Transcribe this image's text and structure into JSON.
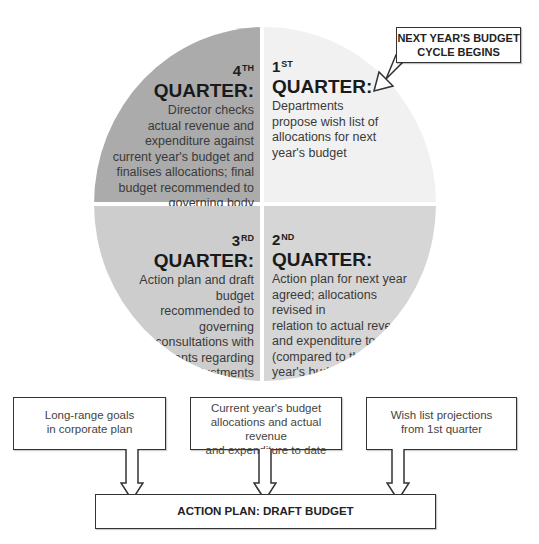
{
  "diagram": {
    "quarters": [
      {
        "id": "q1",
        "number": "1",
        "suffix": "ST",
        "title": "QUARTER:",
        "text": "Departments propose wish list of allocations for next year's budget",
        "lines": [
          "Departments",
          "propose wish list of",
          "allocations for next",
          "year's budget"
        ],
        "fill": "#f1f1f1"
      },
      {
        "id": "q2",
        "number": "2",
        "suffix": "ND",
        "title": "QUARTER:",
        "text": "Action plan for next year agreed; allocations revised in relation to actual revenue and expenditure to date (compared to the current year's budget) and to action plan objectives",
        "lines": [
          "Action plan for next year",
          "agreed; allocations revised in",
          "relation to actual revenue",
          "and expenditure to date",
          "(compared to the current",
          "year's budget) and to",
          "action plan",
          "objectives"
        ],
        "fill": "#d6d6d6"
      },
      {
        "id": "q3",
        "number": "3",
        "suffix": "RD",
        "title": "QUARTER:",
        "text": "Action plan and draft budget recommended to governing body; consultations with departments regarding adjustments",
        "lines": [
          "Action plan and draft budget",
          "recommended to governing",
          "body; consultations with",
          "departments regarding",
          "adjustments"
        ],
        "fill": "#cdcdcd"
      },
      {
        "id": "q4",
        "number": "4",
        "suffix": "TH",
        "title": "QUARTER:",
        "text": "Director checks actual revenue and expenditure against current year's budget and finalises allocations; final budget recommended to governing body",
        "lines": [
          "Director checks",
          "actual revenue and",
          "expenditure against",
          "current year's budget and",
          "finalises allocations; final",
          "budget recommended to",
          "governing body"
        ],
        "fill": "#ababab"
      }
    ],
    "callout": {
      "line1": "NEXT YEAR'S BUDGET",
      "line2": "CYCLE BEGINS"
    },
    "inputs": [
      {
        "id": "long-range-goals",
        "lines": [
          "Long-range goals",
          "in corporate plan"
        ]
      },
      {
        "id": "current-year-budget",
        "lines": [
          "Current year's budget",
          "allocations and actual revenue",
          "and expenditure to date"
        ]
      },
      {
        "id": "wish-list-projections",
        "lines": [
          "Wish list projections",
          "from 1st quarter"
        ]
      }
    ],
    "output": {
      "label": "ACTION PLAN: DRAFT BUDGET"
    },
    "colors": {
      "stroke": "#333333",
      "text": "#2b2b2b"
    }
  }
}
